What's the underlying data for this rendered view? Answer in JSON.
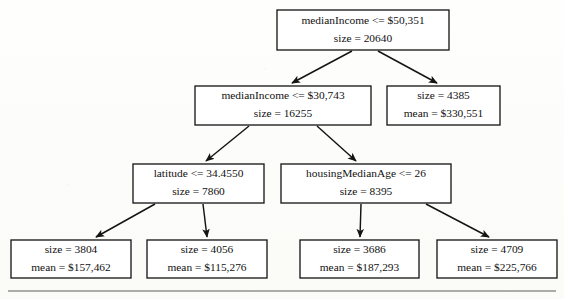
{
  "figure": {
    "type": "decision-tree",
    "background_color": "#fdfdfb",
    "line_color": "#141414",
    "text_color": "#111111",
    "footer_rule": {
      "x1": 8,
      "x2": 556,
      "y": 291
    }
  },
  "nodes": [
    {
      "id": "root",
      "kind": "split",
      "line1": "medianIncome <= $50,351",
      "line2": "size = 20640",
      "feature": "medianIncome",
      "threshold": "$50,351",
      "size": 20640,
      "box": {
        "x": 277,
        "y": 10,
        "w": 172,
        "h": 40
      }
    },
    {
      "id": "n-left",
      "kind": "split",
      "line1": "medianIncome <= $30,743",
      "line2": "size = 16255",
      "feature": "medianIncome",
      "threshold": "$30,743",
      "size": 16255,
      "box": {
        "x": 195,
        "y": 86,
        "w": 176,
        "h": 39
      }
    },
    {
      "id": "n-right",
      "kind": "leaf",
      "line1": "size = 4385",
      "line2": "mean = $330,551",
      "size": 4385,
      "mean": "$330,551",
      "box": {
        "x": 387,
        "y": 86,
        "w": 113,
        "h": 39
      }
    },
    {
      "id": "n-ll",
      "kind": "split",
      "line1": "latitude <= 34.4550",
      "line2": "size = 7860",
      "feature": "latitude",
      "threshold": "34.4550",
      "size": 7860,
      "box": {
        "x": 133,
        "y": 164,
        "w": 131,
        "h": 39
      }
    },
    {
      "id": "n-lr",
      "kind": "split",
      "line1": "housingMedianAge <= 26",
      "line2": "size = 8395",
      "feature": "housingMedianAge",
      "threshold": "26",
      "size": 8395,
      "box": {
        "x": 281,
        "y": 164,
        "w": 170,
        "h": 39
      }
    },
    {
      "id": "leaf-1",
      "kind": "leaf",
      "line1": "size = 3804",
      "line2": "mean = $157,462",
      "size": 3804,
      "mean": "$157,462",
      "box": {
        "x": 11,
        "y": 240,
        "w": 120,
        "h": 38
      }
    },
    {
      "id": "leaf-2",
      "kind": "leaf",
      "line1": "size = 4056",
      "line2": "mean = $115,276",
      "size": 4056,
      "mean": "$115,276",
      "box": {
        "x": 147,
        "y": 240,
        "w": 120,
        "h": 38
      }
    },
    {
      "id": "leaf-3",
      "kind": "leaf",
      "line1": "size = 3686",
      "line2": "mean = $187,293",
      "size": 3686,
      "mean": "$187,293",
      "box": {
        "x": 300,
        "y": 240,
        "w": 119,
        "h": 38
      }
    },
    {
      "id": "leaf-4",
      "kind": "leaf",
      "line1": "size = 4709",
      "line2": "mean = $225,766",
      "size": 4709,
      "mean": "$225,766",
      "box": {
        "x": 437,
        "y": 240,
        "w": 120,
        "h": 38
      }
    }
  ],
  "edges": [
    {
      "id": "e-root-left",
      "from": "root",
      "to": "n-left",
      "x1": 352,
      "y1": 51,
      "x2": 292,
      "y2": 83
    },
    {
      "id": "e-root-right",
      "from": "root",
      "to": "n-right",
      "x1": 378,
      "y1": 51,
      "x2": 437,
      "y2": 83
    },
    {
      "id": "e-left-ll",
      "from": "n-left",
      "to": "n-ll",
      "x1": 249,
      "y1": 126,
      "x2": 206,
      "y2": 161
    },
    {
      "id": "e-left-lr",
      "from": "n-left",
      "to": "n-lr",
      "x1": 317,
      "y1": 126,
      "x2": 356,
      "y2": 161
    },
    {
      "id": "e-ll-leaf1",
      "from": "n-ll",
      "to": "leaf-1",
      "x1": 155,
      "y1": 204,
      "x2": 96,
      "y2": 237
    },
    {
      "id": "e-ll-leaf2",
      "from": "n-ll",
      "to": "leaf-2",
      "x1": 203,
      "y1": 204,
      "x2": 207,
      "y2": 237
    },
    {
      "id": "e-lr-leaf3",
      "from": "n-lr",
      "to": "leaf-3",
      "x1": 361,
      "y1": 204,
      "x2": 360,
      "y2": 237
    },
    {
      "id": "e-lr-leaf4",
      "from": "n-lr",
      "to": "leaf-4",
      "x1": 426,
      "y1": 204,
      "x2": 489,
      "y2": 237
    }
  ]
}
